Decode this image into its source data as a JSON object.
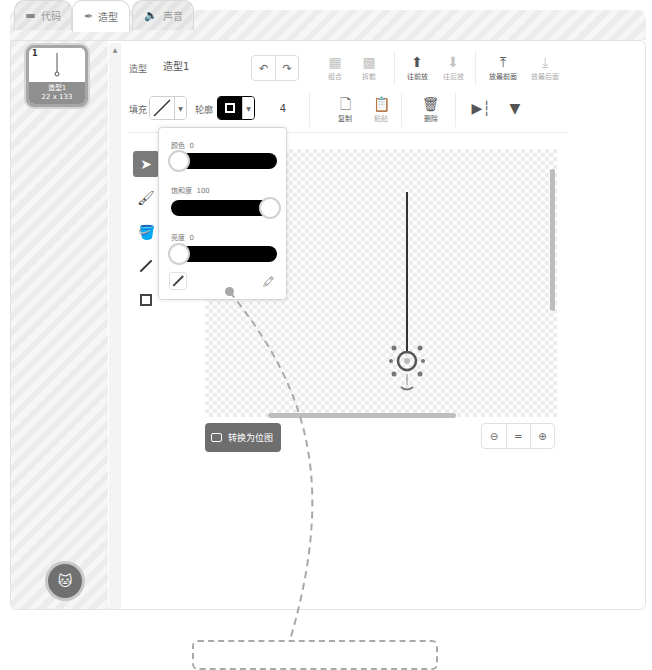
{
  "tabs": [
    {
      "label": "代码",
      "icon": "code-icon",
      "active": false
    },
    {
      "label": "造型",
      "icon": "brush-icon",
      "active": true
    },
    {
      "label": "声音",
      "icon": "speaker-icon",
      "active": false
    }
  ],
  "costume_list": {
    "items": [
      {
        "index": "1",
        "name": "造型1",
        "size": "22 x 133",
        "selected": true
      }
    ],
    "add_button_icon": "add-sprite-cat-icon"
  },
  "toolbar": {
    "costume_label": "造型",
    "costume_name": "造型1",
    "undo_icon": "undo-icon",
    "redo_icon": "redo-icon",
    "group_label": "组合",
    "ungroup_label": "拆散",
    "forward_label": "往前放",
    "backward_label": "往后放",
    "front_label": "放最前面",
    "back_label": "放最后面",
    "fill_label": "填充",
    "outline_label": "轮廓",
    "outline_width": "4",
    "copy_label": "复制",
    "paste_label": "粘贴",
    "delete_label": "删除",
    "flip_h_icon": "flip-horizontal-icon",
    "flip_v_icon": "flip-vertical-icon"
  },
  "tools": [
    {
      "name": "select",
      "icon": "arrow-pointer-icon",
      "selected": true
    },
    {
      "name": "brush",
      "icon": "brush-icon",
      "selected": false
    },
    {
      "name": "fill",
      "icon": "paint-bucket-icon",
      "selected": false
    },
    {
      "name": "line",
      "icon": "line-icon",
      "selected": false
    },
    {
      "name": "rectangle",
      "icon": "rectangle-icon",
      "selected": false
    }
  ],
  "color_popover": {
    "color_label": "颜色",
    "color_value": "0",
    "saturation_label": "饱和度",
    "saturation_value": "100",
    "brightness_label": "亮度",
    "brightness_value": "0"
  },
  "canvas": {
    "convert_button": "转换为位图",
    "zoom_out_icon": "zoom-out-icon",
    "zoom_reset_label": "=",
    "zoom_in_icon": "zoom-in-icon"
  },
  "colors": {
    "outline": "#000000",
    "selected_tool_bg": "#7a7a7a",
    "convert_button_bg": "#6e6e6e"
  }
}
